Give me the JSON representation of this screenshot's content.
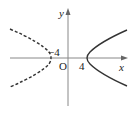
{
  "diagram": {
    "type": "hyperbola-graph",
    "axes": {
      "x_label": "x",
      "y_label": "y",
      "origin_label": "O"
    },
    "labels": {
      "left_vertex": "−4",
      "right_vertex": "4"
    },
    "branches": [
      {
        "name": "left-branch",
        "style": "dashed",
        "vertex_x": -4
      },
      {
        "name": "right-branch",
        "style": "solid",
        "vertex_x": 4
      }
    ],
    "colors": {
      "axis": "#888888",
      "curve": "#333333",
      "text": "#222222"
    }
  }
}
